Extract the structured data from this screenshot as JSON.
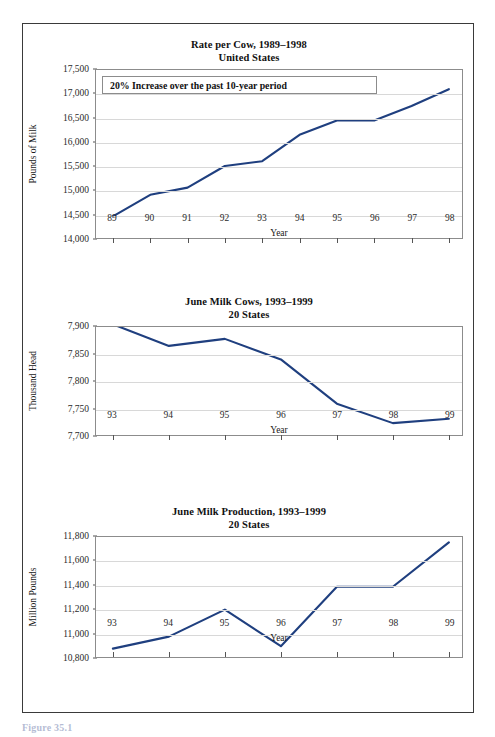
{
  "figure": {
    "caption": "Figure 35.1"
  },
  "charts": [
    {
      "title_line1": "Rate per Cow, 1989–1998",
      "title_line2": "United States",
      "ylabel": "Pounds of Milk",
      "xlabel": "Year",
      "yticks": [
        "14,000",
        "14,500",
        "15,000",
        "15,500",
        "16,000",
        "16,500",
        "17,000",
        "17,500"
      ],
      "xticks": [
        "89",
        "90",
        "91",
        "92",
        "93",
        "94",
        "95",
        "96",
        "97",
        "98"
      ],
      "annotation": "20% Increase over the past 10-year period"
    },
    {
      "title_line1": "June Milk Cows, 1993–1999",
      "title_line2": "20 States",
      "ylabel": "Thousand Head",
      "xlabel": "Year",
      "yticks": [
        "7,700",
        "7,750",
        "7,800",
        "7,850",
        "7,900"
      ],
      "xticks": [
        "93",
        "94",
        "95",
        "96",
        "97",
        "98",
        "99"
      ],
      "annotation": null
    },
    {
      "title_line1": "June Milk Production, 1993–1999",
      "title_line2": "20 States",
      "ylabel": "Million Pounds",
      "xlabel": "Year",
      "yticks": [
        "10,800",
        "11,000",
        "11,200",
        "11,400",
        "11,600",
        "11,800"
      ],
      "xticks": [
        "93",
        "94",
        "95",
        "96",
        "97",
        "98",
        "99"
      ],
      "annotation": null
    }
  ],
  "chart_data": [
    {
      "type": "line",
      "title": "Rate per Cow, 1989–1998 — United States",
      "xlabel": "Year",
      "ylabel": "Pounds of Milk",
      "categories": [
        "89",
        "90",
        "91",
        "92",
        "93",
        "94",
        "95",
        "96",
        "97",
        "98"
      ],
      "values": [
        14450,
        14900,
        15050,
        15500,
        15600,
        16150,
        16450,
        16450,
        16750,
        17100
      ],
      "ylim": [
        14000,
        17500
      ],
      "ytick_step": 500,
      "grid": true,
      "legend": false,
      "line_color": "#1f3f7f",
      "annotations": [
        "20% Increase over the past 10-year period"
      ]
    },
    {
      "type": "line",
      "title": "June Milk Cows, 1993–1999 — 20 States",
      "xlabel": "Year",
      "ylabel": "Thousand Head",
      "categories": [
        "93",
        "94",
        "95",
        "96",
        "97",
        "98",
        "99"
      ],
      "values": [
        7905,
        7865,
        7878,
        7840,
        7758,
        7722,
        7730
      ],
      "ylim": [
        7700,
        7900
      ],
      "ytick_step": 50,
      "grid": true,
      "legend": false,
      "line_color": "#1f3f7f",
      "annotations": []
    },
    {
      "type": "line",
      "title": "June Milk Production, 1993–1999 — 20 States",
      "xlabel": "Year",
      "ylabel": "Million Pounds",
      "categories": [
        "93",
        "94",
        "95",
        "96",
        "97",
        "98",
        "99"
      ],
      "values": [
        10870,
        10970,
        11195,
        10890,
        11385,
        11385,
        11755
      ],
      "ylim": [
        10800,
        11800
      ],
      "ytick_step": 200,
      "grid": true,
      "legend": false,
      "line_color": "#1f3f7f",
      "annotations": []
    }
  ]
}
